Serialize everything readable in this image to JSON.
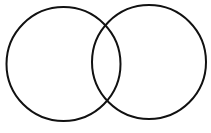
{
  "diagram": {
    "type": "venn",
    "background": "#ffffff",
    "stroke_color": "#111111",
    "stroke_width": 2,
    "circles": [
      {
        "name": "left-circle",
        "cx": 63.5,
        "cy": 64,
        "r": 57
      },
      {
        "name": "right-circle",
        "cx": 149,
        "cy": 62,
        "r": 57
      }
    ]
  }
}
